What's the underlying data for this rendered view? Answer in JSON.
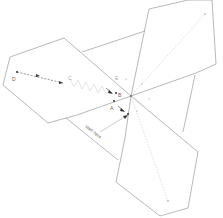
{
  "diagram": {
    "title": "",
    "points": [
      {
        "id": "A",
        "label": "A"
      },
      {
        "id": "B",
        "label": "B"
      },
      {
        "id": "C",
        "label": "C"
      },
      {
        "id": "D",
        "label": "D"
      },
      {
        "id": "E",
        "label": "E"
      }
    ],
    "annotation": "start here",
    "shapes": [
      "hexagon-left",
      "hexagon-top-right",
      "hexagon-bottom-right"
    ],
    "colors": {
      "outline": "#8a8a8a",
      "guide": "#c8c8c8",
      "marker": "#333333"
    }
  }
}
